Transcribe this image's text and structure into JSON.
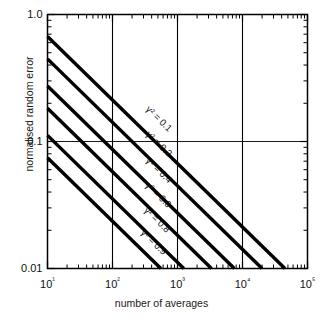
{
  "chart_data": {
    "type": "line",
    "title": "",
    "xlabel": "number of averages",
    "ylabel": "normalised random error",
    "xscale": "log",
    "yscale": "log",
    "xlim": [
      10,
      100000
    ],
    "ylim": [
      0.01,
      1.0
    ],
    "grid": true,
    "grid_lines": {
      "x": [
        100,
        1000,
        10000
      ],
      "y": [
        0.1
      ]
    },
    "xticklabels": [
      "10¹",
      "10²",
      "10³",
      "10⁴",
      "10⁵"
    ],
    "xtickvalues": [
      10,
      100,
      1000,
      10000,
      100000
    ],
    "yticklabels": [
      "1.0",
      "0.1",
      "0.01"
    ],
    "ytickvalues": [
      1.0,
      0.1,
      0.01
    ],
    "legend_position": "inline-labels",
    "series": [
      {
        "name": "γ² = 0.1",
        "gamma_squared": 0.1,
        "label": "γ² = 0.1",
        "x": [
          10,
          45000
        ],
        "y": [
          0.6708,
          0.01
        ],
        "label_x": 480,
        "label_y": 0.145
      },
      {
        "name": "γ² = 0.2",
        "gamma_squared": 0.2,
        "label": "γ² = 0.2",
        "x": [
          10,
          20000
        ],
        "y": [
          0.4472,
          0.01
        ],
        "label_x": 480,
        "label_y": 0.092
      },
      {
        "name": "γ² = 0.4",
        "gamma_squared": 0.4,
        "label": "γ² = 0.4",
        "x": [
          10,
          7500
        ],
        "y": [
          0.2739,
          0.01
        ],
        "label_x": 480,
        "label_y": 0.057
      },
      {
        "name": "γ² = 0.6",
        "gamma_squared": 0.6,
        "label": "γ² = 0.6",
        "x": [
          10,
          3333
        ],
        "y": [
          0.1826,
          0.01
        ],
        "label_x": 470,
        "label_y": 0.0365
      },
      {
        "name": "γ² = 0.8",
        "gamma_squared": 0.8,
        "label": "γ² = 0.8",
        "x": [
          10,
          1250
        ],
        "y": [
          0.1118,
          0.01
        ],
        "label_x": 450,
        "label_y": 0.0232
      },
      {
        "name": "γ² = 0.9",
        "gamma_squared": 0.9,
        "label": "γ² = 0.9",
        "x": [
          10,
          555
        ],
        "y": [
          0.0745,
          0.01
        ],
        "label_x": 400,
        "label_y": 0.0155
      }
    ]
  },
  "axes": {
    "xlabel": "number of averages",
    "ylabel": "normalised random error"
  }
}
